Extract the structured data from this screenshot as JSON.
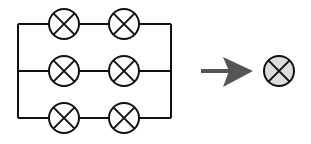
{
  "diagram": {
    "circuit": {
      "branches": 3,
      "lamps_per_branch": 2,
      "total_lamps": 6,
      "lamp_symbol": "circle-with-cross",
      "wire_color": "#111111"
    },
    "arrow": {
      "direction": "right",
      "color": "#555555"
    },
    "equivalent_lamp": {
      "symbol": "circle-with-cross",
      "fill": "#dcdcdc"
    }
  }
}
